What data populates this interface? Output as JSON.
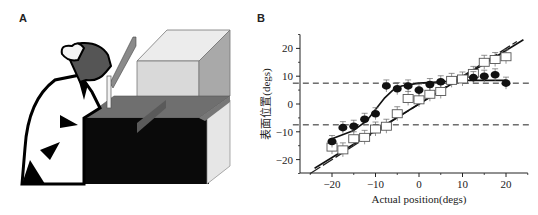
{
  "panels": {
    "a": {
      "label": "A",
      "description": "Seated subject looking down at a table through a mirror/box apparatus"
    },
    "b": {
      "label": "B"
    }
  },
  "chart_data": {
    "type": "scatter",
    "title": "",
    "xlabel": "Actual position(degs)",
    "ylabel": "表面位置(degs)",
    "xlim": [
      -25,
      25
    ],
    "ylim": [
      -25,
      25
    ],
    "x_ticks": [
      -20,
      -10,
      0,
      10,
      20
    ],
    "y_ticks": [
      -20,
      -10,
      0,
      10,
      20
    ],
    "x_tick_labels": [
      "−20",
      "−10",
      "0",
      "10",
      "20"
    ],
    "y_tick_labels": [
      "−20",
      "−10",
      "0",
      "10",
      "20"
    ],
    "grid": false,
    "reference_lines": [
      {
        "type": "horizontal-dashed",
        "y": 7.5
      },
      {
        "type": "horizontal-dashed",
        "y": -7.5
      },
      {
        "type": "diagonal-dashed",
        "label": "identity",
        "slope": 1
      }
    ],
    "series": [
      {
        "name": "filled circles",
        "marker": "filled-circle",
        "x": [
          -20,
          -17.5,
          -15,
          -12.5,
          -10,
          -7.5,
          -5,
          -2.5,
          0,
          2.5,
          5,
          12.5,
          15,
          17.5,
          20
        ],
        "y": [
          -13.5,
          -8.5,
          -8,
          -5.5,
          -3.5,
          6.5,
          5.5,
          6.5,
          5,
          7,
          8,
          9.5,
          10,
          10.5,
          7.5
        ]
      },
      {
        "name": "open squares",
        "marker": "open-square",
        "x": [
          -20,
          -17.5,
          -15,
          -12.5,
          -10,
          -7.5,
          -5,
          -2.5,
          0,
          2.5,
          5,
          7.5,
          10,
          12.5,
          15,
          17.5,
          20
        ],
        "y": [
          -15.5,
          -16.5,
          -12.5,
          -12,
          -9,
          -8,
          -3.5,
          2,
          1.5,
          3.5,
          4.5,
          8.5,
          9,
          11,
          15,
          16,
          17
        ]
      }
    ],
    "fit_lines": [
      {
        "name": "sigmoid fit (circles)",
        "style": "solid",
        "x": [
          -20,
          -15,
          -12,
          -10,
          -8,
          -6,
          -4,
          0,
          5,
          10,
          15,
          20
        ],
        "y": [
          -12.5,
          -9.5,
          -6,
          -2,
          2,
          5,
          6.5,
          7.5,
          8,
          8.5,
          8.5,
          8.5
        ]
      },
      {
        "name": "linear fit (squares)",
        "style": "solid",
        "slope": 0.9,
        "intercept": 0
      }
    ],
    "legend": null
  }
}
